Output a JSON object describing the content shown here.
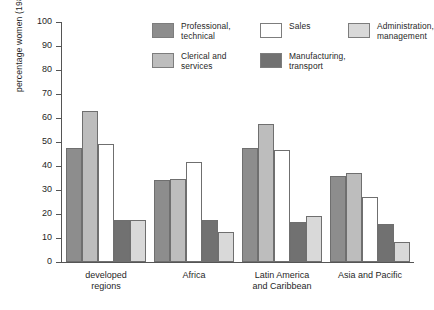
{
  "chart_data": {
    "type": "bar",
    "title": "",
    "xlabel": "",
    "ylabel": "percentage women (1980s)",
    "ylim": [
      0,
      100
    ],
    "ytick_step": 10,
    "yticks": [
      0,
      10,
      20,
      30,
      40,
      50,
      60,
      70,
      80,
      90,
      100
    ],
    "grid": false,
    "legend_position": "top-center",
    "categories": [
      "developed\nregions",
      "Africa",
      "Latin America\nand Caribbean",
      "Asia and Pacific"
    ],
    "series": [
      {
        "name": "Professional,\ntechnical",
        "color": "#8d8d8d",
        "values": [
          47.5,
          34.0,
          47.5,
          36.0
        ]
      },
      {
        "name": "Clerical and\nservices",
        "color": "#bdbdbd",
        "values": [
          63.0,
          34.5,
          57.5,
          37.0
        ]
      },
      {
        "name": "Sales",
        "color": "#ffffff",
        "values": [
          49.0,
          41.5,
          46.5,
          27.0
        ]
      },
      {
        "name": "Manufacturing,\ntransport",
        "color": "#717171",
        "values": [
          17.5,
          17.5,
          16.5,
          16.0
        ]
      },
      {
        "name": "Administration,\nmanagement",
        "color": "#d9d9d9",
        "values": [
          17.5,
          12.5,
          19.0,
          8.5
        ]
      }
    ]
  },
  "axis": {
    "y_title": "percentage women (1980s)"
  }
}
